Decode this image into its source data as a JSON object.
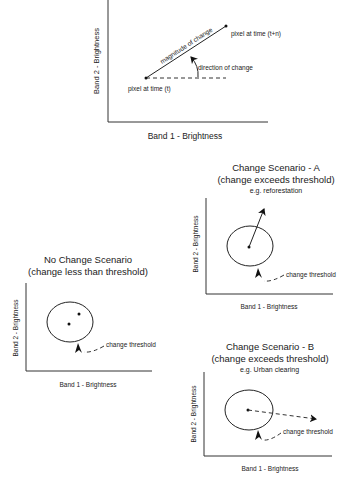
{
  "top_diagram": {
    "y_axis_label": "Band 2 - Brightness",
    "x_axis_label": "Band 1 - Brightness",
    "vector_label": "magnitude of change",
    "start_label": "pixel at time (t)",
    "end_label": "pixel at time (t+n)",
    "angle_label": "direction of change"
  },
  "no_change": {
    "title": "No Change Scenario",
    "subtitle": "(change less than threshold)",
    "y_axis_label": "Band 2 - Brightness",
    "x_axis_label": "Band 1 - Brightness",
    "threshold_label": "change threshold"
  },
  "scenario_a": {
    "title": "Change Scenario - A",
    "subtitle": "(change exceeds threshold)",
    "example": "e.g. reforestation",
    "y_axis_label": "Band 2 - Brightness",
    "x_axis_label": "Band 1 - Brightness",
    "threshold_label": "change threshold"
  },
  "scenario_b": {
    "title": "Change Scenario - B",
    "subtitle": "(change exceeds threshold)",
    "example": "e.g. Urban clearing",
    "y_axis_label": "Band 2 - Brightness",
    "x_axis_label": "Band 1 - Brightness",
    "threshold_label": "change threshold"
  }
}
